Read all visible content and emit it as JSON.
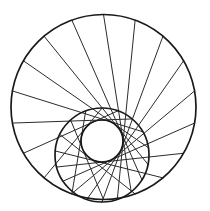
{
  "diagram": {
    "title": "",
    "background": "#ffffff",
    "stroke_color": "#1a1a1a",
    "spoke_color": "#2b2b2b",
    "outer_circle": {
      "cx": 103.5,
      "cy": 107,
      "r": 92.5
    },
    "middle_circle": {
      "cx": 102,
      "cy": 155,
      "r": 47
    },
    "inner_circle": {
      "cx": 102,
      "cy": 141,
      "r": 21
    },
    "spoke_count": 18,
    "spoke_start_angle_deg": -90,
    "spoke_step_deg": 20,
    "spoke_rule": "each spoke starts on the outer circle, runs tangent to the inner circle (clockwise side) and ends where it exits the middle circle"
  }
}
